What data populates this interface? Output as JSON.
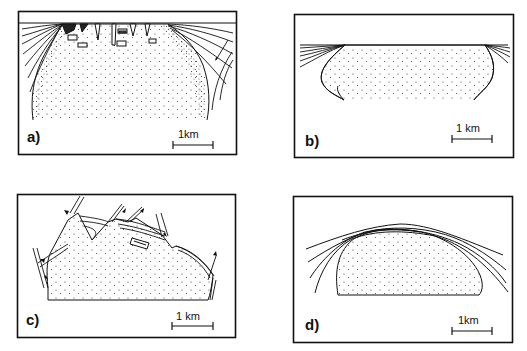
{
  "figure": {
    "panels": [
      {
        "id": "a",
        "label": "a)",
        "scale_label": "1km"
      },
      {
        "id": "b",
        "label": "b)",
        "scale_label": "1 km"
      },
      {
        "id": "c",
        "label": "c)",
        "scale_label": "1 km"
      },
      {
        "id": "d",
        "label": "d)",
        "scale_label": "1km"
      }
    ]
  },
  "colors": {
    "ink": "#111111",
    "paper": "#ffffff"
  }
}
